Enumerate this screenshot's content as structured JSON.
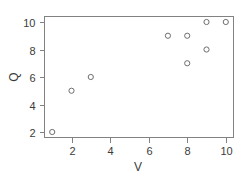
{
  "chart_data": {
    "type": "scatter",
    "title": "",
    "xlabel": "V",
    "ylabel": "Q",
    "xlim": [
      0.6,
      10.4
    ],
    "ylim": [
      1.6,
      10.4
    ],
    "xticks": [
      2,
      4,
      6,
      8,
      10
    ],
    "yticks": [
      2,
      4,
      6,
      8,
      10
    ],
    "xtick_labels": [
      "2",
      "4",
      "6",
      "8",
      "10"
    ],
    "ytick_labels": [
      "2",
      "4",
      "6",
      "8",
      "10"
    ],
    "grid": false,
    "legend": null,
    "marker": "open-circle",
    "marker_color": "#6e6e6e",
    "frame_color": "#828282",
    "background_color": "#ffffff",
    "x": [
      1,
      2,
      3,
      7,
      8,
      8,
      9,
      9,
      10
    ],
    "y": [
      2,
      5,
      6,
      9,
      9,
      7,
      10,
      8,
      10
    ],
    "points": [
      {
        "x": 1,
        "y": 2
      },
      {
        "x": 2,
        "y": 5
      },
      {
        "x": 3,
        "y": 6
      },
      {
        "x": 7,
        "y": 9
      },
      {
        "x": 8,
        "y": 9
      },
      {
        "x": 8,
        "y": 7
      },
      {
        "x": 9,
        "y": 10
      },
      {
        "x": 9,
        "y": 8
      },
      {
        "x": 10,
        "y": 10
      }
    ]
  }
}
